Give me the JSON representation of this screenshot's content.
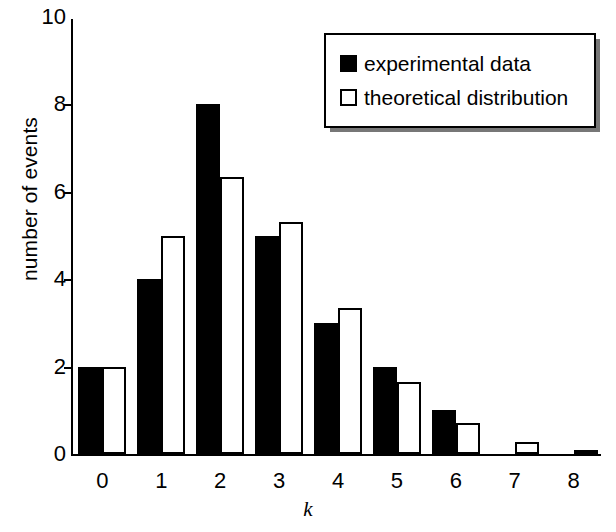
{
  "chart_data": {
    "type": "bar",
    "title": "",
    "xlabel": "k",
    "ylabel": "number of events",
    "categories": [
      "0",
      "1",
      "2",
      "3",
      "4",
      "5",
      "6",
      "7",
      "8"
    ],
    "xlim": [
      -0.5,
      8.5
    ],
    "ylim": [
      0,
      10
    ],
    "yticks": [
      0,
      2,
      4,
      6,
      8,
      10
    ],
    "grid": false,
    "legend_position": "top-right",
    "series": [
      {
        "name": "experimental data",
        "color": "#000000",
        "style": "filled",
        "values": [
          2,
          4,
          8,
          5,
          3,
          2,
          1,
          0,
          0
        ]
      },
      {
        "name": "theoretical distribution",
        "color": "#ffffff",
        "style": "outline",
        "values": [
          2,
          5,
          6.35,
          5.3,
          3.35,
          1.65,
          0.7,
          0.28,
          0.05
        ]
      }
    ]
  },
  "axes": {
    "ylabel": "number of events",
    "xlabel": "k",
    "ytick_labels": [
      "0",
      "2",
      "4",
      "6",
      "8",
      "10"
    ],
    "xtick_labels": [
      "0",
      "1",
      "2",
      "3",
      "4",
      "5",
      "6",
      "7",
      "8"
    ]
  },
  "legend": {
    "items": [
      {
        "label": "experimental data",
        "swatch": "filled-square"
      },
      {
        "label": "theoretical distribution",
        "swatch": "open-square"
      }
    ]
  },
  "colors": {
    "foreground": "#000000",
    "background": "#ffffff",
    "legend_shadow": "#777777"
  }
}
